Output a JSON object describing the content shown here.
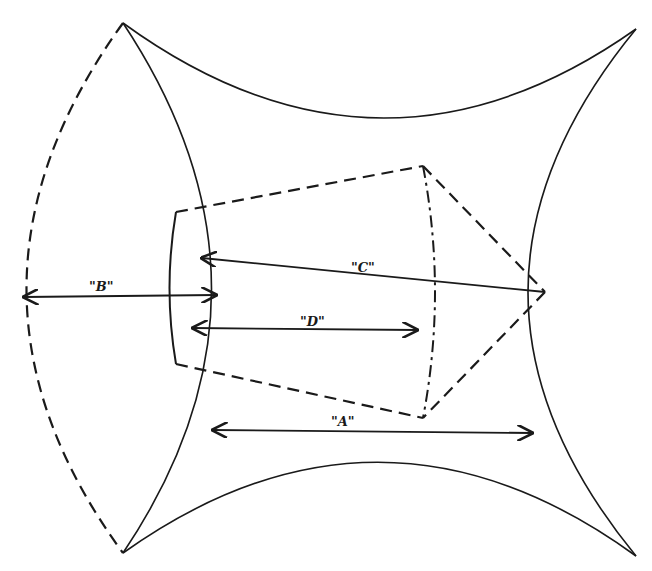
{
  "diagram": {
    "type": "technical-geometry-drawing",
    "stroke_color": "#1a1a1a",
    "background": "#ffffff",
    "dimensions": [
      {
        "id": "A",
        "label": "\"A\"",
        "x1": 213,
        "y1": 430,
        "x2": 532,
        "y2": 433
      },
      {
        "id": "B",
        "label": "\"B\"",
        "x1": 24,
        "y1": 297,
        "x2": 216,
        "y2": 295
      },
      {
        "id": "C",
        "label": "\"C\"",
        "x1": 202,
        "y1": 258,
        "x2": 545,
        "y2": 292
      },
      {
        "id": "D",
        "label": "\"D\"",
        "x1": 193,
        "y1": 328,
        "x2": 417,
        "y2": 330
      }
    ],
    "vertices": {
      "outer_top_left": [
        123,
        23
      ],
      "outer_top_right": [
        636,
        29
      ],
      "outer_bottom_right": [
        636,
        556
      ],
      "outer_bottom_left": [
        123,
        553
      ],
      "trapezoid_top_left": [
        176,
        212
      ],
      "trapezoid_top_right": [
        423,
        166
      ],
      "trapezoid_bottom_right": [
        423,
        418
      ],
      "trapezoid_bottom_left": [
        176,
        364
      ],
      "apex_point": [
        545,
        292
      ]
    }
  }
}
